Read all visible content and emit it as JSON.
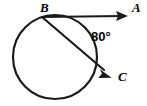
{
  "figure": {
    "kind": "circle-tangent-chord-geometry",
    "background_color": "#ffffff",
    "stroke_color": "#1a1a1a",
    "canvas": {
      "width": 147,
      "height": 106
    },
    "circle": {
      "cx": 55,
      "cy": 57,
      "r": 42
    },
    "points": {
      "B": {
        "label": "B",
        "x": 42,
        "y": 17,
        "label_x": 40,
        "label_y": 12
      },
      "A": {
        "label": "A",
        "x": 127,
        "y": 16,
        "label_x": 133,
        "label_y": 12
      },
      "C": {
        "label": "C",
        "x": 110,
        "y": 75,
        "label_x": 119,
        "label_y": 80
      }
    },
    "rays": [
      {
        "name": "tangent-ray-BA",
        "from": "B",
        "to": "A",
        "arrow": true
      },
      {
        "name": "secant-ray-BC",
        "from": "B",
        "to": "C",
        "arrow": true
      }
    ],
    "angle": {
      "label": "80°",
      "value": 80,
      "unit": "degrees",
      "label_x": 92,
      "label_y": 40,
      "between": [
        "tangent-ray-BA",
        "secant-ray-BC"
      ],
      "vertex": "B"
    }
  }
}
